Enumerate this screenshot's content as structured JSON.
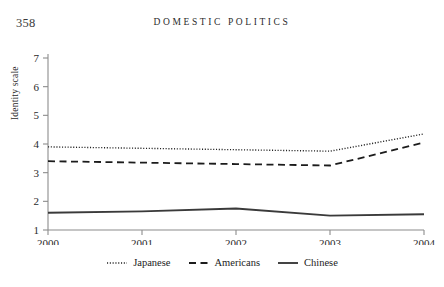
{
  "page": {
    "folio": "358",
    "running_head": "DOMESTIC POLITICS"
  },
  "chart_data": {
    "type": "line",
    "title": "",
    "xlabel": "",
    "ylabel": "Identity scale",
    "x": [
      "2000",
      "2001",
      "2002",
      "2003",
      "2004"
    ],
    "categories": [
      "2000",
      "2001",
      "2002",
      "2003",
      "2004"
    ],
    "xlim": [
      2000,
      2004
    ],
    "ylim": [
      1,
      7
    ],
    "yticks": [
      "1",
      "2",
      "3",
      "4",
      "5",
      "6",
      "7"
    ],
    "xticks": [
      "2000",
      "2001",
      "2002",
      "2003",
      "2004"
    ],
    "grid": false,
    "legend_position": "bottom-center",
    "series": [
      {
        "name": "Japanese",
        "style": "dotted",
        "values": [
          3.9,
          3.85,
          3.8,
          3.75,
          4.35
        ]
      },
      {
        "name": "Americans",
        "style": "dashed",
        "values": [
          3.4,
          3.35,
          3.3,
          3.25,
          4.05
        ]
      },
      {
        "name": "Chinese",
        "style": "solid",
        "values": [
          1.6,
          1.65,
          1.75,
          1.5,
          1.55
        ]
      }
    ]
  },
  "legend": {
    "items": [
      {
        "label": "Japanese",
        "style": "dotted"
      },
      {
        "label": "Americans",
        "style": "dashed"
      },
      {
        "label": "Chinese",
        "style": "solid"
      }
    ]
  }
}
